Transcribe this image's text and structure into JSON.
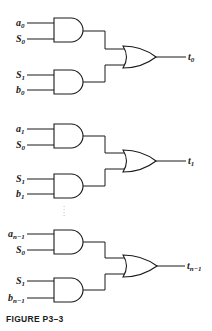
{
  "figure": {
    "caption": "FIGURE P3–3",
    "ellipsis": ":",
    "groups": [
      {
        "and_top_inputs": [
          {
            "base": "a",
            "sub": "0"
          },
          {
            "base": "S",
            "sub": "0"
          }
        ],
        "and_bottom_inputs": [
          {
            "base": "S",
            "sub": "1"
          },
          {
            "base": "b",
            "sub": "0"
          }
        ],
        "output": {
          "base": "t",
          "sub": "0"
        }
      },
      {
        "and_top_inputs": [
          {
            "base": "a",
            "sub": "1"
          },
          {
            "base": "S",
            "sub": "0"
          }
        ],
        "and_bottom_inputs": [
          {
            "base": "S",
            "sub": "1"
          },
          {
            "base": "b",
            "sub": "1"
          }
        ],
        "output": {
          "base": "t",
          "sub": "1"
        }
      },
      {
        "and_top_inputs": [
          {
            "base": "a",
            "sub": "n−1"
          },
          {
            "base": "S",
            "sub": "0"
          }
        ],
        "and_bottom_inputs": [
          {
            "base": "S",
            "sub": "1"
          },
          {
            "base": "b",
            "sub": "n−1"
          }
        ],
        "output": {
          "base": "t",
          "sub": "n−1"
        }
      }
    ]
  }
}
